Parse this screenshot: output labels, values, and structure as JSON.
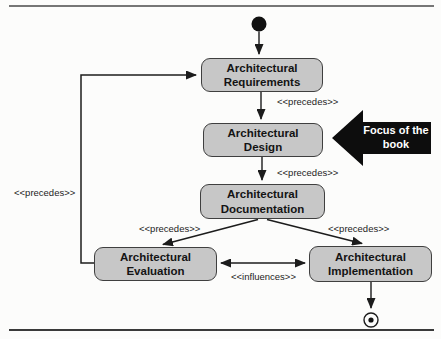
{
  "diagram": {
    "nodes": {
      "requirements": {
        "label": "Architectural\nRequirements"
      },
      "design": {
        "label": "Architectural\nDesign"
      },
      "documentation": {
        "label": "Architectural\nDocumentation"
      },
      "evaluation": {
        "label": "Architectural\nEvaluation"
      },
      "implementation": {
        "label": "Architectural\nImplementation"
      }
    },
    "edge_labels": {
      "requirements_to_design": "<<precedes>>",
      "design_to_documentation": "<<precedes>>",
      "documentation_to_evaluation": "<<precedes>>",
      "documentation_to_implementation": "<<precedes>>",
      "evaluation_to_requirements": "<<precedes>>",
      "evaluation_implementation": "<<influences>>"
    },
    "callout": {
      "label": "Focus of the\nbook"
    },
    "colors": {
      "node_fill": "#c7c7c7",
      "node_border": "#3f3f3f",
      "line": "#1c1c1c",
      "callout_fill": "#0d0d0d",
      "callout_text": "#ffffff",
      "background": "#fcfcfb"
    }
  }
}
